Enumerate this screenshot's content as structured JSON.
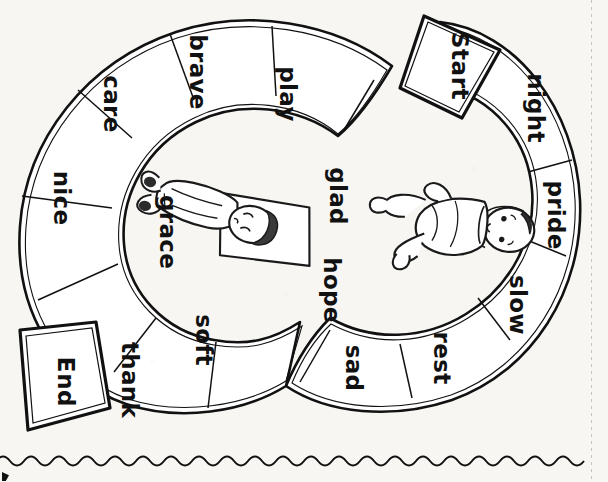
{
  "page": {
    "type": "worksheet-board-game",
    "orientation": "text-rotated-90-clockwise",
    "background_color": "#f7f6f3",
    "ink_color": "#111111"
  },
  "board": {
    "name": "s-shaped-path-board",
    "shape": "S-curve track",
    "cell_count": 16,
    "cells": [
      {
        "id": "start",
        "label": "Start",
        "emphasis": "bold",
        "border": "double"
      },
      {
        "id": "night",
        "label": "night",
        "emphasis": "normal",
        "border": "single"
      },
      {
        "id": "pride",
        "label": "pride",
        "emphasis": "normal",
        "border": "single"
      },
      {
        "id": "slow",
        "label": "slow",
        "emphasis": "normal",
        "border": "single"
      },
      {
        "id": "rest",
        "label": "rest",
        "emphasis": "normal",
        "border": "single"
      },
      {
        "id": "sad",
        "label": "sad",
        "emphasis": "normal",
        "border": "single"
      },
      {
        "id": "hope",
        "label": "hope",
        "emphasis": "normal",
        "border": "single"
      },
      {
        "id": "glad",
        "label": "glad",
        "emphasis": "normal",
        "border": "single"
      },
      {
        "id": "play",
        "label": "play",
        "emphasis": "normal",
        "border": "single"
      },
      {
        "id": "brave",
        "label": "brave",
        "emphasis": "normal",
        "border": "single"
      },
      {
        "id": "care",
        "label": "care",
        "emphasis": "normal",
        "border": "single"
      },
      {
        "id": "nice",
        "label": "nice",
        "emphasis": "normal",
        "border": "single"
      },
      {
        "id": "grace",
        "label": "grace",
        "emphasis": "normal",
        "border": "single"
      },
      {
        "id": "soft",
        "label": "soft",
        "emphasis": "normal",
        "border": "single"
      },
      {
        "id": "thank",
        "label": "thank",
        "emphasis": "normal",
        "border": "single"
      },
      {
        "id": "end",
        "label": "End",
        "emphasis": "bold",
        "border": "double"
      }
    ]
  },
  "illustrations": [
    {
      "id": "sleeping-child",
      "description": "child sleeping on a pillow",
      "style": "black-and-white line art"
    },
    {
      "id": "seated-baby",
      "description": "baby sitting",
      "style": "black-and-white line art"
    }
  ],
  "decorations": {
    "wavy_tear_line": "wavy-line",
    "perforation_line": "dotted-vertical-line",
    "corner_mark": "corner-registration-mark"
  }
}
